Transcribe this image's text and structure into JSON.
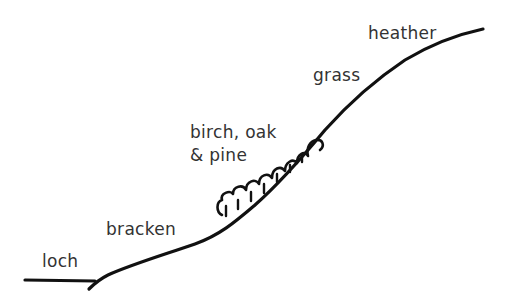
{
  "diagram": {
    "type": "hillside vegetation zones sketch",
    "zones": [
      {
        "id": "loch",
        "label": "loch"
      },
      {
        "id": "bracken",
        "label": "bracken"
      },
      {
        "id": "trees",
        "label_line1": "birch, oak",
        "label_line2": "& pine"
      },
      {
        "id": "grass",
        "label": "grass"
      },
      {
        "id": "heather",
        "label": "heather"
      }
    ],
    "colors": {
      "line": "#111111",
      "text": "#333333",
      "background": "#ffffff"
    }
  }
}
